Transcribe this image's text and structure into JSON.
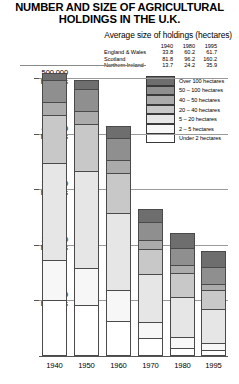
{
  "title": {
    "line1": "NUMBER AND SIZE OF AGRICULTURAL",
    "line2": "HOLDINGS IN THE U.K."
  },
  "subtitle": "Average size of holdings (hectares)",
  "avg_size_table": {
    "corner": "",
    "columns": [
      "1940",
      "1980",
      "1995"
    ],
    "rows": [
      {
        "region": "England & Wales",
        "values": [
          "33.8",
          "60.2",
          "61.7"
        ]
      },
      {
        "region": "Scotland",
        "values": [
          "81.8",
          "96.2",
          "160.2"
        ]
      },
      {
        "region": "Northern Ireland",
        "values": [
          "13.7",
          "24.2",
          "35.9"
        ]
      }
    ]
  },
  "legend": {
    "items": [
      {
        "label": "Over 100 hectares",
        "color": "#6e6e6e"
      },
      {
        "label": "50 – 100 hectares",
        "color": "#8f8f8f"
      },
      {
        "label": "40 – 50 hectares",
        "color": "#ababab"
      },
      {
        "label": "20 – 40 hectares",
        "color": "#c8c8c8"
      },
      {
        "label": "5 – 20 hectares",
        "color": "#e6e6e6"
      },
      {
        "label": "2 – 5 hectares",
        "color": "#f7f7f7"
      },
      {
        "label": "Under 2 hectares",
        "color": "#ffffff"
      }
    ]
  },
  "axes": {
    "y_ticks": [
      {
        "value": 500000,
        "line1": "500 000",
        "line2": "holdings"
      },
      {
        "value": 400000,
        "line1": "400 000",
        "line2": "holdings"
      },
      {
        "value": 300000,
        "line1": "300 000",
        "line2": "holdings"
      },
      {
        "value": 200000,
        "line1": "200 000",
        "line2": "holdings"
      },
      {
        "value": 100000,
        "line1": "100 000",
        "line2": "holdings"
      }
    ],
    "x_labels": [
      "1940",
      "1950",
      "1960",
      "1970",
      "1980",
      "1995"
    ]
  },
  "chart_data": {
    "type": "bar",
    "subtype": "stacked",
    "title": "NUMBER AND SIZE OF AGRICULTURAL HOLDINGS IN THE U.K.",
    "subtitle": "Average size of holdings (hectares)",
    "xlabel": "",
    "ylabel": "holdings",
    "ylim": [
      0,
      540000
    ],
    "grid": true,
    "legend_position": "top-right",
    "categories": [
      "1940",
      "1950",
      "1960",
      "1970",
      "1980",
      "1995"
    ],
    "series": [
      {
        "name": "Under 2 hectares",
        "color": "#ffffff",
        "values": [
          100000,
          92000,
          63000,
          32000,
          14000,
          10000
        ]
      },
      {
        "name": "2 - 5 hectares",
        "color": "#f7f7f7",
        "values": [
          72000,
          66000,
          55000,
          30000,
          20000,
          13000
        ]
      },
      {
        "name": "5 - 20 hectares",
        "color": "#e6e6e6",
        "values": [
          176000,
          175000,
          140000,
          86000,
          73000,
          62000
        ]
      },
      {
        "name": "20 - 40 hectares",
        "color": "#c8c8c8",
        "values": [
          86000,
          84000,
          72000,
          45000,
          42000,
          33000
        ]
      },
      {
        "name": "40 - 50 hectares",
        "color": "#ababab",
        "values": [
          24000,
          24000,
          22000,
          15000,
          14000,
          12000
        ]
      },
      {
        "name": "50 - 100 hectares",
        "color": "#8f8f8f",
        "values": [
          38000,
          40000,
          41000,
          33000,
          32000,
          31000
        ]
      },
      {
        "name": "Over 100 hectares",
        "color": "#6e6e6e",
        "values": [
          14000,
          16000,
          21000,
          24000,
          26000,
          28000
        ]
      }
    ],
    "totals": [
      510000,
      497000,
      414000,
      265000,
      221000,
      189000
    ],
    "average_size_hectares": {
      "columns": [
        "1940",
        "1980",
        "1995"
      ],
      "England & Wales": [
        33.8,
        60.2,
        61.7
      ],
      "Scotland": [
        81.8,
        96.2,
        160.2
      ],
      "Northern Ireland": [
        13.7,
        24.2,
        35.9
      ]
    }
  }
}
